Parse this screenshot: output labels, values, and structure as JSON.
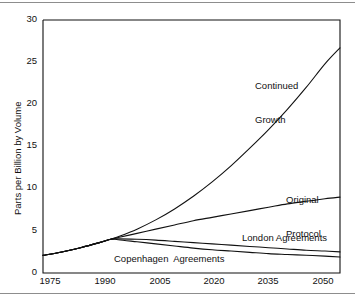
{
  "figure": {
    "background_color": "#ffffff",
    "line_color": "#111111",
    "rule_color": "#8d8d8d"
  },
  "chart_data": {
    "type": "line",
    "title": "",
    "subtitle": "",
    "xlabel": "",
    "ylabel": "Parts per Billion by Volume",
    "xlim": [
      1975,
      2054
    ],
    "ylim": [
      0,
      30
    ],
    "grid": false,
    "legend": "inline-labels",
    "xticks": [
      1975,
      1990,
      2005,
      2020,
      2035,
      2050
    ],
    "xtick_labels": [
      "1975",
      "1990",
      "2005",
      "2020",
      "2035",
      "2050"
    ],
    "yticks": [
      0,
      5,
      10,
      15,
      20,
      25,
      30
    ],
    "ytick_labels": [
      "0",
      "5",
      "10",
      "15",
      "20",
      "25",
      "30"
    ],
    "annotations": [
      {
        "name": "continued-growth",
        "text_line1": "Continued",
        "text_line2": "Growth"
      },
      {
        "name": "original-protocol",
        "text_line1": "Original",
        "text_line2": "Protocol"
      },
      {
        "name": "london-agreements",
        "text_line1": "London Agreements",
        "text_line2": ""
      },
      {
        "name": "copenhagen-agreements",
        "text_line1": "Copenhagen  Agreements",
        "text_line2": ""
      }
    ],
    "series": [
      {
        "name": "Continued Growth",
        "x": [
          1975,
          1980,
          1985,
          1990,
          1993,
          1995,
          2000,
          2005,
          2010,
          2015,
          2020,
          2025,
          2030,
          2035,
          2040,
          2045,
          2050,
          2054
        ],
        "values": [
          2.1,
          2.5,
          3.0,
          3.6,
          4.0,
          4.3,
          5.2,
          6.3,
          7.6,
          9.1,
          10.8,
          12.7,
          14.8,
          17.0,
          19.4,
          22.0,
          24.8,
          26.7
        ]
      },
      {
        "name": "Original Protocol",
        "x": [
          1975,
          1980,
          1985,
          1990,
          1993,
          1995,
          2000,
          2005,
          2010,
          2015,
          2020,
          2025,
          2030,
          2035,
          2040,
          2045,
          2050,
          2054
        ],
        "values": [
          2.1,
          2.5,
          3.0,
          3.6,
          4.0,
          4.2,
          4.7,
          5.2,
          5.7,
          6.2,
          6.6,
          7.0,
          7.4,
          7.8,
          8.2,
          8.5,
          8.8,
          9.0
        ]
      },
      {
        "name": "London Agreements",
        "x": [
          1975,
          1980,
          1985,
          1990,
          1993,
          1995,
          2000,
          2005,
          2010,
          2015,
          2020,
          2025,
          2030,
          2035,
          2040,
          2045,
          2050,
          2054
        ],
        "values": [
          2.1,
          2.5,
          3.0,
          3.6,
          4.0,
          4.05,
          4.0,
          3.9,
          3.75,
          3.6,
          3.45,
          3.3,
          3.15,
          3.0,
          2.85,
          2.7,
          2.6,
          2.5
        ]
      },
      {
        "name": "Copenhagen Agreements",
        "x": [
          1975,
          1980,
          1985,
          1990,
          1993,
          1995,
          2000,
          2005,
          2010,
          2015,
          2020,
          2025,
          2030,
          2035,
          2040,
          2045,
          2050,
          2054
        ],
        "values": [
          2.1,
          2.5,
          3.0,
          3.6,
          4.0,
          3.95,
          3.7,
          3.45,
          3.2,
          2.95,
          2.75,
          2.6,
          2.45,
          2.3,
          2.2,
          2.1,
          2.0,
          1.9
        ]
      }
    ]
  }
}
